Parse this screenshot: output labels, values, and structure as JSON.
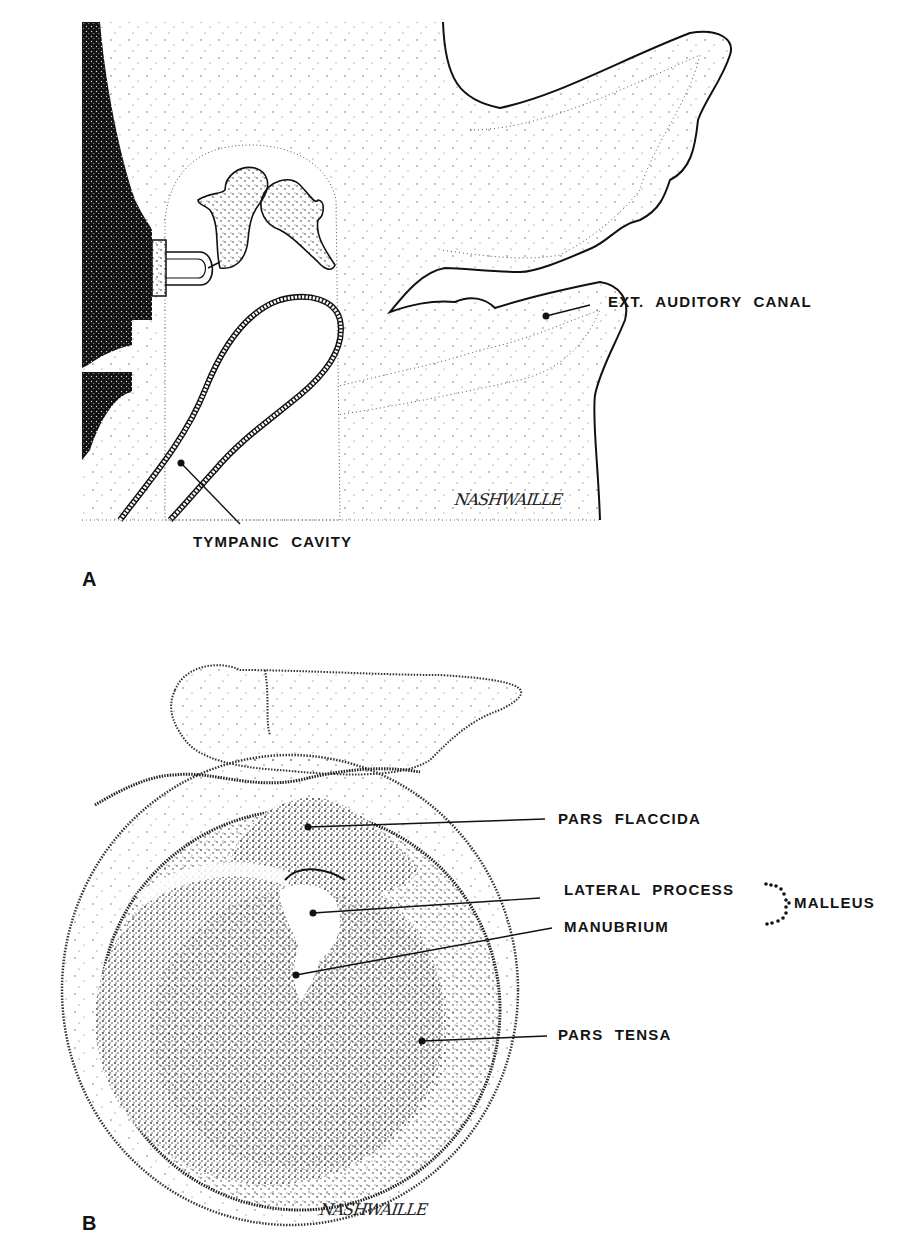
{
  "figure": {
    "panel_a": {
      "letter": "A",
      "labels": {
        "ext_auditory_canal": "EXT. AUDITORY CANAL",
        "tympanic_cavity": "TYMPANIC CAVITY"
      },
      "signature": "NASHWAILLE"
    },
    "panel_b": {
      "letter": "B",
      "labels": {
        "pars_flaccida": "PARS FLACCIDA",
        "lateral_process": "LATERAL PROCESS",
        "manubrium": "MANUBRIUM",
        "malleus": "MALLEUS",
        "pars_tensa": "PARS TENSA"
      },
      "signature": "NASHWAILLE"
    }
  }
}
